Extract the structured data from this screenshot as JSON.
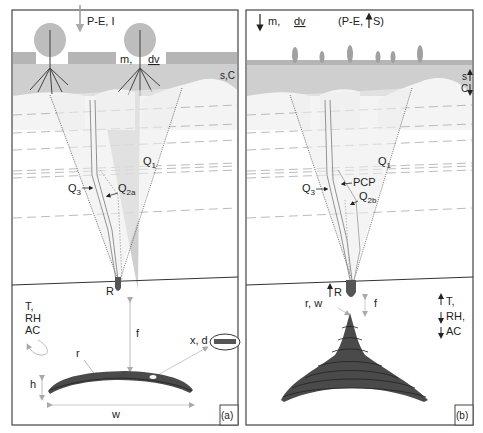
{
  "panels": [
    {
      "id": "a",
      "tag": "(a)",
      "top_labels": {
        "flux": "P-E, I",
        "vegetation": "m,",
        "dv": "dv",
        "soil": "s,C"
      },
      "flow_labels": {
        "q1": "Q",
        "q1_sub": "1",
        "q3": "Q",
        "q3_sub": "3",
        "q2": "Q",
        "q2_sub": "2a"
      },
      "drip_label": "R",
      "cave_labels": {
        "climate": [
          "T,",
          "RH",
          "AC"
        ],
        "f": "f",
        "r": "r",
        "h": "h",
        "w": "w",
        "xd": "x, d"
      }
    },
    {
      "id": "b",
      "tag": "(b)",
      "top_labels": {
        "m": "m,",
        "dv": "dv",
        "flux": "(P-E,",
        "s_arrow": "S)",
        "s": "s",
        "c": "C"
      },
      "flow_labels": {
        "q1": "Q",
        "q1_sub": "1",
        "q3": "Q",
        "q3_sub": "3",
        "pcp": "PCP",
        "q2": "Q",
        "q2_sub": "2b"
      },
      "drip_label": "R",
      "cave_labels": {
        "rw": "r, w",
        "f": "f",
        "climate": [
          "T,",
          "RH,",
          "AC"
        ]
      }
    }
  ],
  "colors": {
    "soil": "#c9c9c9",
    "grass": "#b5b5b5",
    "stalagmite": "#4a4a4a",
    "arrow": "#aaaaaa",
    "line": "#333333"
  }
}
